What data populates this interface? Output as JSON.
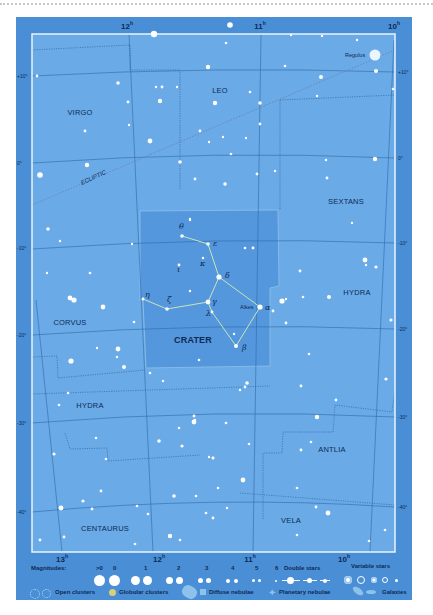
{
  "chart_title": "Crater star chart",
  "colors": {
    "panel": "#4a8fd6",
    "sky": "#6aaae6",
    "crater_region": "#5597dc",
    "frame": "#e9f4ff",
    "grid": "#2f6aa8",
    "boundary": "#2a5f99",
    "ecliptic": "#6a7aa0",
    "star": "#ffffff",
    "label": "#0d2a55",
    "stick": "#c9e4b8"
  },
  "axes": {
    "ra_top": [
      {
        "label": "12",
        "sup": "h",
        "x": 127
      },
      {
        "label": "11",
        "sup": "h",
        "x": 260
      },
      {
        "label": "10",
        "sup": "h",
        "x": 394
      }
    ],
    "ra_bottom": [
      {
        "label": "13",
        "sup": "h",
        "x": 62
      },
      {
        "label": "12",
        "sup": "h",
        "x": 159
      },
      {
        "label": "11",
        "sup": "h",
        "x": 250
      },
      {
        "label": "10",
        "sup": "h",
        "x": 344
      }
    ],
    "dec_left": [
      {
        "label": "+10°",
        "y": 76
      },
      {
        "label": "0°",
        "y": 163
      },
      {
        "label": "-10°",
        "y": 248
      },
      {
        "label": "-20°",
        "y": 335
      },
      {
        "label": "-30°",
        "y": 423
      },
      {
        "label": "-40°",
        "y": 512
      }
    ],
    "dec_right": [
      {
        "label": "+10°",
        "y": 72
      },
      {
        "label": "0°",
        "y": 158
      },
      {
        "label": "-10°",
        "y": 243
      },
      {
        "label": "-20°",
        "y": 329
      },
      {
        "label": "-30°",
        "y": 417
      },
      {
        "label": "-40°",
        "y": 507
      }
    ]
  },
  "constellations": [
    {
      "name": "VIRGO",
      "x": 80,
      "y": 112
    },
    {
      "name": "LEO",
      "x": 220,
      "y": 90
    },
    {
      "name": "SEXTANS",
      "x": 346,
      "y": 201
    },
    {
      "name": "HYDRA",
      "x": 357,
      "y": 292
    },
    {
      "name": "CORVUS",
      "x": 70,
      "y": 322
    },
    {
      "name": "CRATER",
      "x": 193,
      "y": 340,
      "highlight": true
    },
    {
      "name": "HYDRA",
      "x": 90,
      "y": 405
    },
    {
      "name": "ANTLIA",
      "x": 332,
      "y": 449
    },
    {
      "name": "CENTAURUS",
      "x": 105,
      "y": 528
    },
    {
      "name": "VELA",
      "x": 291,
      "y": 520
    }
  ],
  "ecliptic_label": "ECLIPTIC",
  "named_stars": [
    {
      "name": "Regulus",
      "x": 375,
      "y": 55,
      "r": 5.5
    },
    {
      "name": "Alkes",
      "x": 260,
      "y": 307,
      "r": 2.8
    }
  ],
  "crater_stars": [
    {
      "greek": "θ",
      "x": 182,
      "y": 236,
      "lx": 179,
      "ly": 230
    },
    {
      "greek": "ε",
      "x": 208,
      "y": 244,
      "lx": 213,
      "ly": 247
    },
    {
      "greek": "κ",
      "x": 203,
      "y": 258,
      "lx": 200,
      "ly": 267
    },
    {
      "greek": "ι",
      "x": 179,
      "y": 265,
      "lx": 177,
      "ly": 273
    },
    {
      "greek": "δ",
      "x": 219,
      "y": 277,
      "lx": 225,
      "ly": 279
    },
    {
      "greek": "η",
      "x": 143,
      "y": 299,
      "lx": 145,
      "ly": 298
    },
    {
      "greek": "ζ",
      "x": 167,
      "y": 309,
      "lx": 167,
      "ly": 303
    },
    {
      "greek": "γ",
      "x": 208,
      "y": 302,
      "lx": 212,
      "ly": 305
    },
    {
      "greek": "λ",
      "x": 212,
      "y": 312,
      "lx": 206,
      "ly": 317
    },
    {
      "greek": "α",
      "x": 260,
      "y": 307,
      "lx": 265,
      "ly": 311
    },
    {
      "greek": "β",
      "x": 236,
      "y": 346,
      "lx": 242,
      "ly": 351
    }
  ],
  "legend": {
    "magnitudes_label": "Magnitudes:",
    "magnitudes": [
      ">0",
      "0",
      "1",
      "2",
      "3",
      "4",
      "5",
      "6"
    ],
    "double_stars_label": "Double stars",
    "variable_stars_label": "Variable stars",
    "open_clusters_label": "Open clusters",
    "globular_clusters_label": "Globular clusters",
    "diffuse_nebulae_label": "Diffuse nebulae",
    "planetary_nebulae_label": "Planetary nebulae",
    "galaxies_label": "Galaxies"
  }
}
